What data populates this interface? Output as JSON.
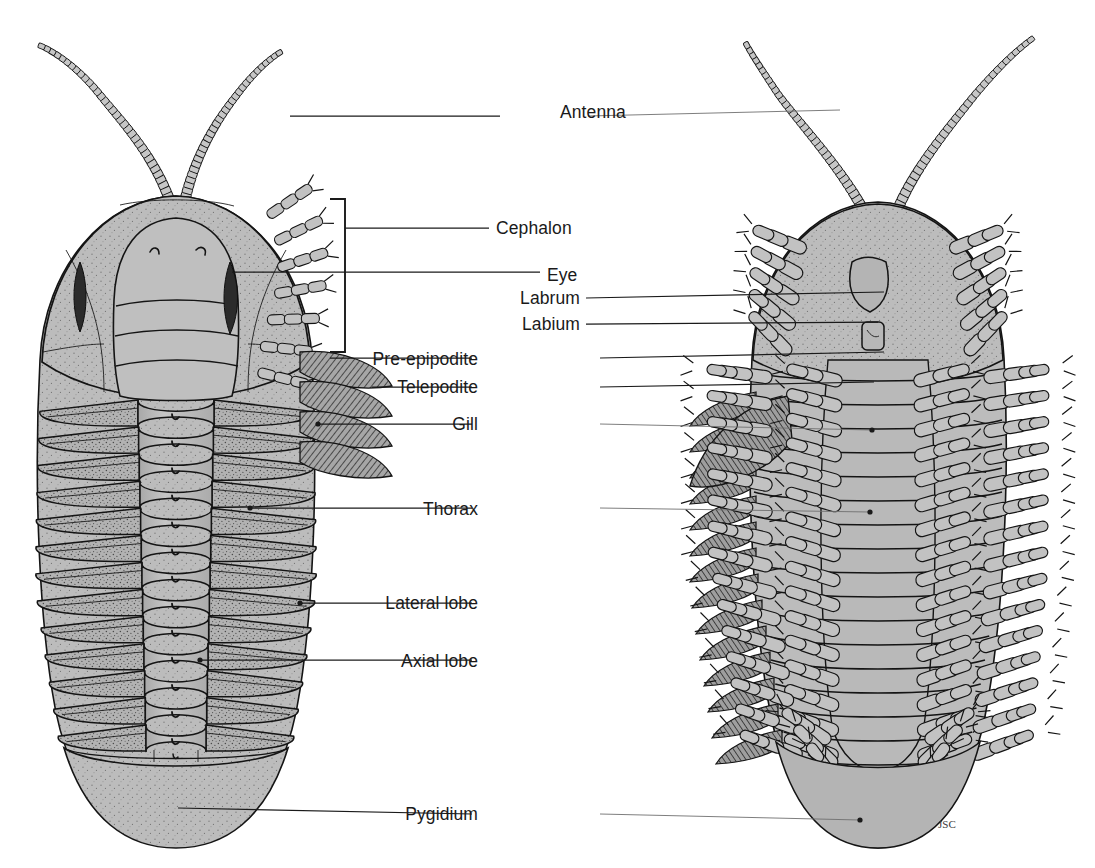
{
  "figure": {
    "views": [
      {
        "id": "dorsal",
        "name": "dorsal-view-specimen",
        "side": "left"
      },
      {
        "id": "ventral",
        "name": "ventral-view-specimen",
        "side": "right"
      }
    ],
    "signature": "JSC",
    "background_color": "#ffffff",
    "ink_color": "#141414",
    "body_fill_color": "#b7b7b7",
    "gill_fill_color": "#9b9b9b",
    "eye_color": "#2b2b2b"
  },
  "labels": [
    {
      "id": "antenna",
      "text": "Antenna",
      "x": 560,
      "y": 118,
      "align": "center",
      "left_line": [
        290,
        116,
        500,
        116
      ],
      "right_line": [
        588,
        116,
        840,
        110
      ]
    },
    {
      "id": "cephalon",
      "text": "Cephalon",
      "x": 496,
      "y": 234,
      "align": "start",
      "left_line": [
        345,
        228,
        489,
        228
      ],
      "right_line": null
    },
    {
      "id": "eye",
      "text": "Eye",
      "x": 547,
      "y": 281,
      "align": "start",
      "left_line": [
        232,
        272,
        540,
        272
      ],
      "right_line": null
    },
    {
      "id": "labrum",
      "text": "Labrum",
      "x": 580,
      "y": 304,
      "align": "end",
      "left_line": null,
      "right_line": [
        586,
        298,
        884,
        292
      ]
    },
    {
      "id": "labium",
      "text": "Labium",
      "x": 580,
      "y": 330,
      "align": "end",
      "left_line": null,
      "right_line": [
        586,
        324,
        878,
        322
      ]
    },
    {
      "id": "pre-epipodite",
      "text": "Pre-epipodite",
      "x": 478,
      "y": 365,
      "align": "end",
      "left_line": [
        330,
        358,
        472,
        358
      ],
      "right_line": [
        600,
        358,
        884,
        352
      ]
    },
    {
      "id": "telepodite",
      "text": "Telepodite",
      "x": 478,
      "y": 393,
      "align": "end",
      "left_line": [
        372,
        387,
        472,
        387
      ],
      "right_line": [
        600,
        387,
        874,
        382
      ]
    },
    {
      "id": "gill",
      "text": "Gill",
      "x": 478,
      "y": 430,
      "align": "end",
      "left_line": [
        318,
        424,
        472,
        424
      ],
      "right_line": [
        600,
        424,
        872,
        430
      ]
    },
    {
      "id": "thorax",
      "text": "Thorax",
      "x": 478,
      "y": 515,
      "align": "end",
      "left_line": [
        250,
        508,
        472,
        508
      ],
      "right_line": [
        600,
        508,
        870,
        512
      ]
    },
    {
      "id": "lateral-lobe",
      "text": "Lateral lobe",
      "x": 478,
      "y": 609,
      "align": "end",
      "left_line": [
        300,
        603,
        472,
        603
      ],
      "right_line": null
    },
    {
      "id": "axial-lobe",
      "text": "Axial lobe",
      "x": 478,
      "y": 667,
      "align": "end",
      "left_line": [
        200,
        660,
        472,
        660
      ],
      "right_line": null
    },
    {
      "id": "pygidium",
      "text": "Pygidium",
      "x": 478,
      "y": 820,
      "align": "end",
      "left_line": [
        178,
        808,
        472,
        814
      ],
      "right_line": [
        600,
        814,
        860,
        820
      ]
    }
  ],
  "dorsal_view": {
    "name": "dorsal-view-specimen",
    "parts": [
      "antennae",
      "cephalon",
      "glabella",
      "eyes",
      "thorax-segments",
      "axial-lobe",
      "pleural-lobes",
      "pygidium"
    ],
    "thorax_segment_count": 13,
    "pygidium_segment_count": 6
  },
  "ventral_view": {
    "name": "ventral-view-specimen",
    "parts": [
      "antennae",
      "cephalon",
      "labrum",
      "labium",
      "telopodites",
      "pre-epipodites",
      "gills",
      "pygidium"
    ],
    "appendage_pair_count": 17
  }
}
